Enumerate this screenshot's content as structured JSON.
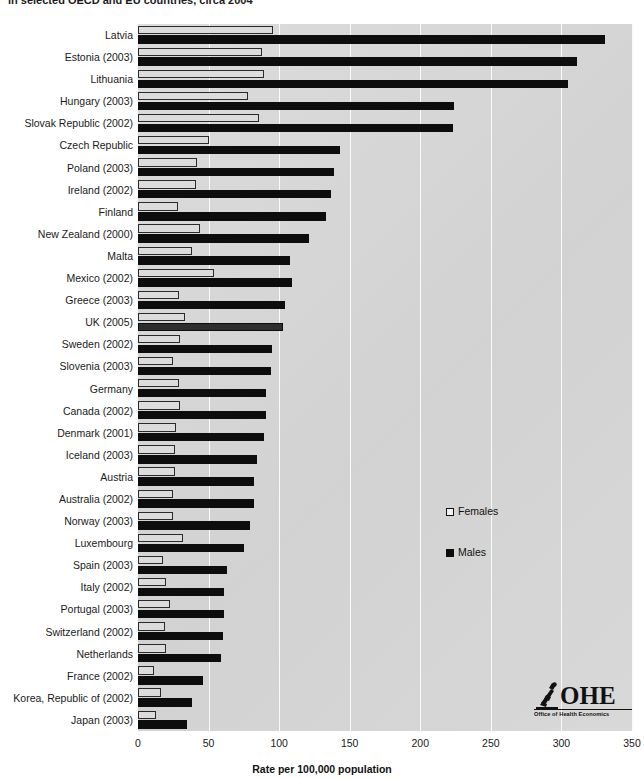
{
  "title": "in selected OECD and EU countries, circa 2004",
  "chart_data": {
    "type": "bar",
    "orientation": "horizontal",
    "title": "in selected OECD and EU countries, circa 2004",
    "xlabel": "Rate per 100,000 population",
    "ylabel": "",
    "xlim": [
      0,
      350
    ],
    "xticks": [
      "0",
      "50",
      "100",
      "150",
      "200",
      "250",
      "300",
      "350"
    ],
    "grid": true,
    "legend_position": "center-right",
    "highlight_category": "UK (2005)",
    "categories": [
      "Latvia",
      "Estonia (2003)",
      "Lithuania",
      "Hungary (2003)",
      "Slovak Republic (2002)",
      "Czech Republic",
      "Poland (2003)",
      "Ireland (2002)",
      "Finland",
      "New Zealand (2000)",
      "Malta",
      "Mexico (2002)",
      "Greece (2003)",
      "UK (2005)",
      "Sweden (2002)",
      "Slovenia (2003)",
      "Germany",
      "Canada (2002)",
      "Denmark (2001)",
      "Iceland (2003)",
      "Austria",
      "Australia (2002)",
      "Norway (2003)",
      "Luxembourg",
      "Spain (2003)",
      "Italy (2002)",
      "Portugal (2003)",
      "Switzerland (2002)",
      "Netherlands",
      "France (2002)",
      "Korea, Republic of (2002)",
      "Japan (2003)"
    ],
    "series": [
      {
        "name": "Females",
        "color": "#dcdcdc",
        "values": [
          96,
          88,
          89,
          78,
          86,
          50,
          42,
          41,
          28,
          44,
          38,
          54,
          29,
          33,
          30,
          25,
          29,
          30,
          27,
          26,
          26,
          25,
          25,
          32,
          18,
          20,
          23,
          19,
          20,
          11,
          16,
          13
        ]
      },
      {
        "name": "Males",
        "color": "#0d0d0d",
        "values": [
          331,
          311,
          305,
          224,
          223,
          143,
          139,
          137,
          133,
          121,
          108,
          109,
          104,
          103,
          95,
          94,
          91,
          91,
          89,
          84,
          82,
          82,
          79,
          75,
          63,
          61,
          61,
          60,
          59,
          46,
          38,
          35
        ]
      }
    ]
  },
  "legend": {
    "items": [
      {
        "label": "Females",
        "swatch": "females-swatch"
      },
      {
        "label": "Males",
        "swatch": "males-swatch"
      }
    ]
  },
  "axis": {
    "x_title": "Rate per 100,000 population",
    "ticks": [
      "0",
      "50",
      "100",
      "150",
      "200",
      "250",
      "300",
      "350"
    ]
  },
  "logo": {
    "mark": "ohe-microscope-icon",
    "name": "OHE",
    "subtitle": "Office of Health Economics"
  }
}
